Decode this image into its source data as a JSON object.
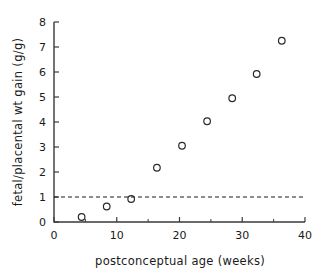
{
  "chart_data": {
    "type": "scatter",
    "title": "",
    "xlabel": "postconceptual age (weeks)",
    "ylabel": "fetal/placental wt gain (g/g)",
    "xlim": [
      0,
      40
    ],
    "ylim": [
      0,
      8
    ],
    "grid": false,
    "legend": null,
    "marker": "open-circle",
    "xticks": [
      0,
      10,
      20,
      30,
      40
    ],
    "xtick_labels": [
      "0",
      "10",
      "20",
      "30",
      "40"
    ],
    "xticks_minor": [
      5,
      15,
      25,
      35
    ],
    "yticks": [
      0,
      1,
      2,
      3,
      4,
      5,
      6,
      7,
      8
    ],
    "ytick_labels": [
      "0",
      "1",
      "2",
      "3",
      "4",
      "5",
      "6",
      "7",
      "8"
    ],
    "x": [
      4.4,
      8.4,
      12.3,
      16.4,
      20.4,
      24.4,
      28.4,
      32.3,
      36.3
    ],
    "y": [
      0.2,
      0.62,
      0.92,
      2.17,
      3.05,
      4.03,
      4.95,
      5.92,
      7.25
    ],
    "points": [
      {
        "x": 4.4,
        "y": 0.2
      },
      {
        "x": 8.4,
        "y": 0.62
      },
      {
        "x": 12.3,
        "y": 0.92
      },
      {
        "x": 16.4,
        "y": 2.17
      },
      {
        "x": 20.4,
        "y": 3.05
      },
      {
        "x": 24.4,
        "y": 4.03
      },
      {
        "x": 28.4,
        "y": 4.95
      },
      {
        "x": 32.3,
        "y": 5.92
      },
      {
        "x": 36.3,
        "y": 7.25
      }
    ],
    "annotations": [
      {
        "type": "hline",
        "name": "unity-reference-line",
        "y": 1.0,
        "style": "dashed"
      }
    ]
  }
}
